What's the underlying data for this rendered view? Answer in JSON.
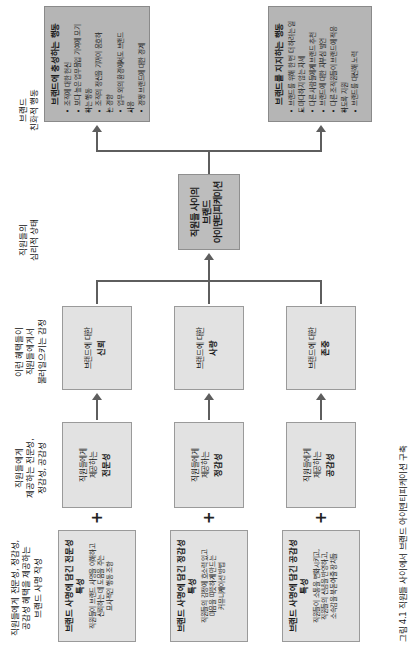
{
  "figure": {
    "caption": "그림 4.1   직원들 사이에서 브랜드 아이덴티피케이션 구축"
  },
  "column_headers": [
    {
      "id": "benefits-mission",
      "text": "직원들에게 전문성, 정감성,\n공감성 혜택을 제공하는\n브랜드 사명 작성"
    },
    {
      "id": "benefits-provided",
      "text": "직원들에게\n제공하는 전문성,\n정감성, 공감성"
    },
    {
      "id": "emotions-evoked",
      "text": "이런 혜택들이\n직원들에게서\n불러일으키는 감정"
    },
    {
      "id": "psych-state",
      "text": "직원들의\n심리적 상태"
    },
    {
      "id": "brand-behavior",
      "text": "브랜드\n친화적 행동"
    }
  ],
  "mission_boxes": [
    {
      "title": "브랜드 사명에 담긴 전문성 특성",
      "body": "직원들이 브랜드 사명을 이해하고\n신뢰하는 데 도움을 주는\n묘사적인 행동 조항"
    },
    {
      "title": "브랜드 사명에 담긴 정감성 특성",
      "body": "직원들의 감정에 호소력 있고\n마음을 따뜻하게 만드는\n커뮤니케이션 방법"
    },
    {
      "title": "브랜드 사명에 담긴 공감성 특성",
      "body": "직원들이 소통을 변화시키고,\n직원들의 신념을 반영하고,\n소속감을 북돋아줄 장치들"
    }
  ],
  "benefit_boxes": [
    {
      "prefix": "직원들에게\n제공하는",
      "label": "전문성"
    },
    {
      "prefix": "직원들에게\n제공하는",
      "label": "정감성"
    },
    {
      "prefix": "직원들에게\n제공하는",
      "label": "공감성"
    }
  ],
  "emotion_boxes": [
    {
      "prefix": "브랜드에 대한",
      "label": "신뢰"
    },
    {
      "prefix": "브랜드에 대한",
      "label": "사랑"
    },
    {
      "prefix": "브랜드에 대한",
      "label": "존중"
    }
  ],
  "identification_box": {
    "title": "직원들 사이의\n브랜드\n아이덴티피케이션"
  },
  "outcome_boxes": [
    {
      "title": "브랜드에 충성하는 행동",
      "bullets": [
        "조직에 대한 헌신",
        "보다 높은 업무몰입 기여에 모기",
        "하는 행동",
        "조직의 정신을 기꺼이 옹호하",
        "는 경향",
        "업무 외의 환경에서도 브랜드",
        "사용",
        "경쟁 브랜드에 대한 경계"
      ]
    },
    {
      "title": "브랜드를 지지하는 행동",
      "bullets": [
        "브랜드를 위해 한 번 더 하려는 일",
        "도 마다하지 않는 자세",
        "다른 사람들에게 브랜드 추천",
        "브랜드에 대한 자부심 발언",
        "다른 조직원들이 브랜드에 적응",
        "하도록 지원",
        "브랜드를 대신해 노력"
      ]
    }
  ],
  "operators": {
    "plus": "+"
  }
}
